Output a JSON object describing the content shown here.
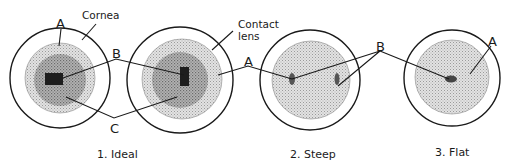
{
  "figure": {
    "panels": [
      {
        "id": "ideal",
        "caption": "1. Ideal"
      },
      {
        "id": "steep",
        "caption": "2. Steep"
      },
      {
        "id": "flat",
        "caption": "3. Flat"
      }
    ],
    "labels": {
      "cornea": "Cornea",
      "contact_lens_line1": "Contact",
      "contact_lens_line2": "lens",
      "a_ideal": "A",
      "b_ideal": "B",
      "c_ideal": "C",
      "a_steep": "A",
      "b_steep_flat": "B",
      "a_flat": "A"
    },
    "colors": {
      "line": "#1a1a1a",
      "lens_fill": "#c9c9c9",
      "pool_fill": "#8f8f8f",
      "touch_fill": "#1e1e1e"
    }
  }
}
